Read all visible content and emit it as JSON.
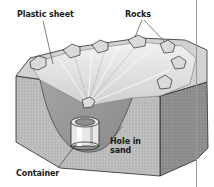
{
  "figure": {
    "type": "solar still cross-section illustration",
    "labels": {
      "plastic_sheet": "Plastic sheet",
      "rocks": "Rocks",
      "hole_in_sand_line1": "Hole in",
      "hole_in_sand_line2": "sand",
      "container": "Container"
    },
    "colors": {
      "sand_light": "#c9c9c9",
      "sand_mid": "#a9a9a9",
      "sand_dark": "#7c7c7c",
      "plastic": "#e4e4e4",
      "rock": "#d8d8d8",
      "outline": "#2a2a2a",
      "label_text": "#1a1a1a"
    }
  }
}
